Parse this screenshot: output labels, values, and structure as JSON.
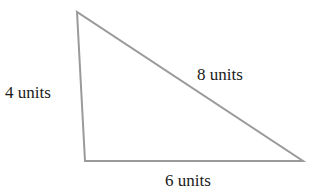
{
  "diagram": {
    "type": "triangle",
    "vertices": {
      "top": [
        77,
        12
      ],
      "bottom_left": [
        85,
        161
      ],
      "bottom_right": [
        303,
        161
      ]
    },
    "stroke_color": "#9a9a9a",
    "text_color": "#1a1a1a",
    "sides": {
      "left": {
        "label": "4 units",
        "length": 4
      },
      "hypotenuse": {
        "label": "8 units",
        "length": 8
      },
      "bottom": {
        "label": "6 units",
        "length": 6
      }
    }
  }
}
